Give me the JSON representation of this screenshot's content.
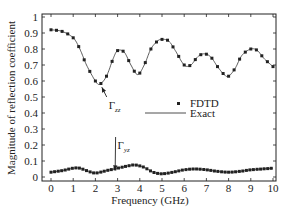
{
  "chart_data": {
    "type": "line",
    "title": "",
    "xlabel": "Frequency (GHz)",
    "ylabel": "Magnitude of reflection coefficient",
    "xlim": [
      0,
      10
    ],
    "ylim": [
      0,
      1
    ],
    "x_ticks": [
      "0",
      "1",
      "2",
      "3",
      "4",
      "5",
      "6",
      "7",
      "8",
      "9",
      "10"
    ],
    "y_ticks": [
      "0",
      "0.1",
      "0.2",
      "0.3",
      "0.4",
      "0.5",
      "0.6",
      "0.7",
      "0.8",
      "0.9",
      "1"
    ],
    "grid": false,
    "legend": {
      "position": "center",
      "entries": [
        {
          "label": "FDTD",
          "style": "marker"
        },
        {
          "label": "Exact",
          "style": "line"
        }
      ]
    },
    "annotations": [
      {
        "text": "Γzz",
        "base": "Γ",
        "sub": "zz",
        "target": [
          2.2,
          0.58
        ],
        "at": [
          2.6,
          0.45
        ]
      },
      {
        "text": "Γyz",
        "base": "Γ",
        "sub": "yz",
        "target": [
          2.8,
          0.06
        ],
        "at": [
          3.0,
          0.2
        ]
      }
    ],
    "series": [
      {
        "name": "Γzz",
        "x": [
          0,
          0.5,
          1.0,
          1.3,
          1.6,
          2.0,
          2.2,
          2.5,
          2.8,
          3.0,
          3.3,
          3.6,
          3.9,
          4.2,
          4.5,
          4.8,
          5.0,
          5.3,
          5.6,
          6.0,
          6.3,
          6.6,
          6.9,
          7.2,
          7.5,
          7.8,
          8.0,
          8.3,
          8.6,
          9.0,
          9.3,
          9.6,
          10.0
        ],
        "y": [
          0.92,
          0.91,
          0.87,
          0.8,
          0.7,
          0.6,
          0.58,
          0.63,
          0.74,
          0.79,
          0.78,
          0.7,
          0.64,
          0.7,
          0.8,
          0.85,
          0.86,
          0.85,
          0.79,
          0.7,
          0.7,
          0.75,
          0.77,
          0.75,
          0.69,
          0.64,
          0.63,
          0.68,
          0.76,
          0.8,
          0.79,
          0.74,
          0.69
        ]
      },
      {
        "name": "Γyz",
        "x": [
          0,
          0.5,
          1.0,
          1.3,
          1.6,
          2.0,
          2.5,
          3.0,
          3.5,
          3.8,
          4.2,
          4.6,
          5.0,
          5.5,
          6.0,
          6.5,
          7.0,
          7.5,
          8.0,
          8.5,
          9.0,
          9.5,
          10.0
        ],
        "y": [
          0.03,
          0.04,
          0.055,
          0.055,
          0.04,
          0.025,
          0.04,
          0.055,
          0.07,
          0.075,
          0.06,
          0.03,
          0.02,
          0.03,
          0.045,
          0.05,
          0.045,
          0.035,
          0.03,
          0.035,
          0.045,
          0.05,
          0.055
        ]
      }
    ]
  }
}
